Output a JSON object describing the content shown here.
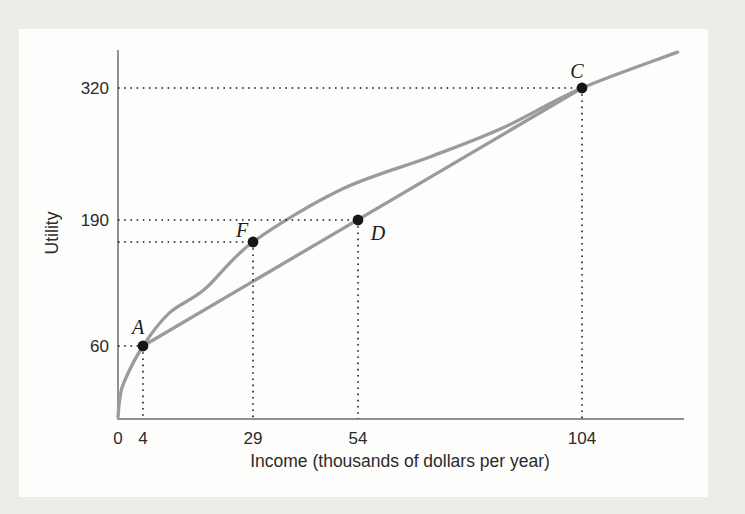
{
  "page": {
    "background_color": "#eeece9",
    "card_color": "#fdfdfc"
  },
  "chart_data": {
    "type": "line",
    "title": "",
    "xlabel": "Income (thousands of dollars per year)",
    "ylabel": "Utility",
    "x_tick_labels": [
      "0",
      "4",
      "29",
      "54",
      "104"
    ],
    "x_tick_values": [
      0,
      4,
      29,
      54,
      104
    ],
    "y_tick_labels": [
      "60",
      "190",
      "320"
    ],
    "y_tick_values": [
      60,
      190,
      320
    ],
    "xlim": [
      0,
      130
    ],
    "ylim": [
      0,
      360
    ],
    "grid": false,
    "legend": "none",
    "axis_color": "#919191",
    "curve_color": "#9b9b9b",
    "point_color": "#161616",
    "guide_color": "#1b1b1b",
    "series": [
      {
        "name": "utility-curve",
        "kind": "smooth",
        "color": "#9b9b9b",
        "points": [
          [
            0,
            0
          ],
          [
            0.3,
            16
          ],
          [
            1,
            30
          ],
          [
            4,
            60
          ],
          [
            10,
            95
          ],
          [
            18,
            120
          ],
          [
            29,
            170
          ],
          [
            50,
            220
          ],
          [
            70,
            252
          ],
          [
            86,
            280
          ],
          [
            104,
            320
          ],
          [
            126,
            355
          ]
        ]
      },
      {
        "name": "chord-line-AC",
        "kind": "straight",
        "color": "#9b9b9b",
        "points": [
          [
            4,
            60
          ],
          [
            104,
            320
          ]
        ]
      }
    ],
    "labeled_points": [
      {
        "label": "A",
        "income": 4,
        "utility": 60
      },
      {
        "label": "F",
        "income": 29,
        "utility": 170
      },
      {
        "label": "D",
        "income": 54,
        "utility": 190
      },
      {
        "label": "C",
        "income": 104,
        "utility": 320
      }
    ]
  }
}
